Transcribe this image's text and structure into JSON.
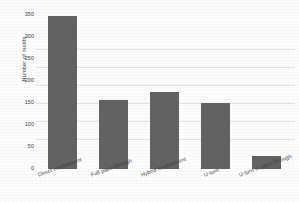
{
  "chart_data": {
    "type": "bar",
    "title": "",
    "xlabel": "",
    "ylabel": "Number of motifs",
    "categories": [
      "Direct involvement",
      "Full pass-through",
      "Hybrid involvement",
      "U-turn",
      "U-turn in pass-through"
    ],
    "values": [
      348,
      157,
      176,
      151,
      30
    ],
    "ylim": [
      0,
      350
    ],
    "yticks": [
      0,
      50,
      100,
      150,
      200,
      250,
      300,
      350
    ],
    "ytick_labels": [
      "0",
      "50",
      "100",
      "150",
      "200",
      "250",
      "300",
      "350"
    ],
    "grid": false,
    "legend": false,
    "bar_color": "#636363",
    "background_color": "#fdfdfd",
    "text_color": "#3a3a3a",
    "xtick_rotation": -20
  }
}
